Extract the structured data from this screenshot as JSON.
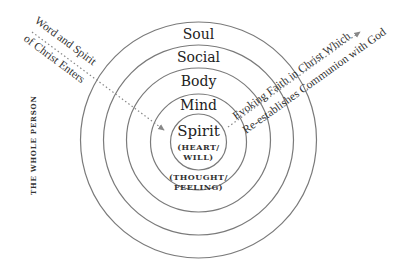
{
  "diagram": {
    "side_title": "THE WHOLE PERSON",
    "layers": [
      {
        "label": "Soul"
      },
      {
        "label": "Social"
      },
      {
        "label": "Body"
      },
      {
        "label": "Mind"
      }
    ],
    "core": {
      "label": "Spirit",
      "sub1_line1": "(HEART/",
      "sub1_line2": "WILL)",
      "sub2_line1": "(THOUGHT/",
      "sub2_line2": "FEELING)"
    },
    "inbound_arrow": {
      "line1": "Word and Spirit",
      "line2": "of Christ Enters"
    },
    "outbound_arrow": {
      "line1": "Evoking Faith in Christ Which",
      "line2": "Re-establishes Communion with God"
    },
    "colors": {
      "ring": "#7a7a7a",
      "text": "#222222",
      "arrow": "#888888"
    }
  }
}
